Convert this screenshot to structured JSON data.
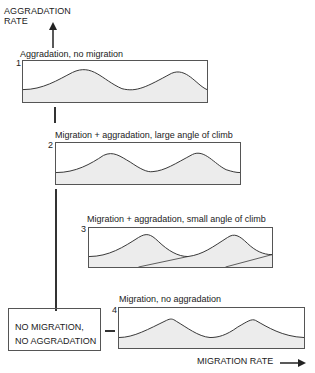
{
  "y_axis": {
    "label_line1": "AGGRADATION",
    "label_line2": "RATE",
    "arrow": "arrow-up"
  },
  "x_axis": {
    "label": "MIGRATION RATE",
    "arrow": "arrow-right"
  },
  "origin_box": {
    "line1": "NO MIGRATION,",
    "line2": "NO AGGRADATION"
  },
  "panels": [
    {
      "number": "1",
      "caption": "Aggradation, no migration"
    },
    {
      "number": "2",
      "caption": "Migration + aggradation, large angle of climb"
    },
    {
      "number": "3",
      "caption": "Migration + aggradation, small angle of climb"
    },
    {
      "number": "4",
      "caption": "Migration, no aggradation"
    }
  ],
  "colors": {
    "line": "#333333",
    "fill": "#ececec",
    "box_border": "#555555"
  }
}
